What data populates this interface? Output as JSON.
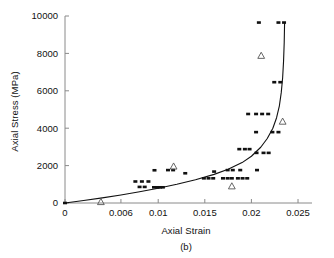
{
  "chart_data": {
    "type": "scatter",
    "title": "",
    "caption": "(b)",
    "xlabel": "Axial Strain",
    "ylabel": "Axial Stress (MPa)",
    "xlim": [
      0,
      0.0265
    ],
    "ylim": [
      0,
      10000
    ],
    "xticks": [
      0,
      0.006,
      0.01,
      0.015,
      0.02,
      0.025
    ],
    "xticklabels": [
      "0",
      "0.006",
      "0.01",
      "0.015",
      "0.02",
      "0.025"
    ],
    "yticks": [
      0,
      2000,
      4000,
      6000,
      8000,
      10000
    ],
    "yticklabels": [
      "0",
      "2000",
      "4000",
      "6000",
      "8000",
      "10000"
    ],
    "grid": false,
    "legend": null,
    "series": [
      {
        "name": "experimental-data",
        "marker": "filled-square",
        "color": "#111111",
        "points": [
          [
            0.0,
            0
          ],
          [
            0.00755,
            1150
          ],
          [
            0.00825,
            1150
          ],
          [
            0.00895,
            1150
          ],
          [
            0.008,
            860
          ],
          [
            0.00855,
            860
          ],
          [
            0.0096,
            1750
          ],
          [
            0.00955,
            840
          ],
          [
            0.0099,
            840
          ],
          [
            0.0102,
            840
          ],
          [
            0.0105,
            840
          ],
          [
            0.01105,
            1760
          ],
          [
            0.0116,
            1760
          ],
          [
            0.0129,
            1590
          ],
          [
            0.0149,
            1320
          ],
          [
            0.0154,
            1320
          ],
          [
            0.0159,
            1320
          ],
          [
            0.016,
            1680
          ],
          [
            0.01695,
            1320
          ],
          [
            0.01745,
            1320
          ],
          [
            0.0179,
            1320
          ],
          [
            0.01745,
            1760
          ],
          [
            0.018,
            1760
          ],
          [
            0.01855,
            1320
          ],
          [
            0.01905,
            1320
          ],
          [
            0.01955,
            1320
          ],
          [
            0.0187,
            2880
          ],
          [
            0.0193,
            2880
          ],
          [
            0.0198,
            2880
          ],
          [
            0.0188,
            1760
          ],
          [
            0.0206,
            1760
          ],
          [
            0.01965,
            4760
          ],
          [
            0.0205,
            4760
          ],
          [
            0.02115,
            4760
          ],
          [
            0.0218,
            4760
          ],
          [
            0.0205,
            3790
          ],
          [
            0.02055,
            2680
          ],
          [
            0.0213,
            2680
          ],
          [
            0.02185,
            2680
          ],
          [
            0.02225,
            3790
          ],
          [
            0.0229,
            3790
          ],
          [
            0.02245,
            6460
          ],
          [
            0.0231,
            6460
          ],
          [
            0.0208,
            9650
          ],
          [
            0.0229,
            9650
          ],
          [
            0.0235,
            9650
          ]
        ]
      },
      {
        "name": "model-prediction-points",
        "marker": "open-triangle",
        "color": "#555555",
        "points": [
          [
            0.00385,
            60
          ],
          [
            0.01165,
            1960
          ],
          [
            0.0179,
            900
          ],
          [
            0.02105,
            7880
          ],
          [
            0.02335,
            4360
          ]
        ]
      },
      {
        "name": "fitted-curve",
        "marker": "line",
        "color": "#111111",
        "points": [
          [
            0.0,
            0
          ],
          [
            0.002,
            130
          ],
          [
            0.004,
            275
          ],
          [
            0.006,
            430
          ],
          [
            0.008,
            600
          ],
          [
            0.01,
            790
          ],
          [
            0.012,
            1000
          ],
          [
            0.014,
            1240
          ],
          [
            0.016,
            1530
          ],
          [
            0.0175,
            1800
          ],
          [
            0.019,
            2160
          ],
          [
            0.02,
            2500
          ],
          [
            0.021,
            2980
          ],
          [
            0.0217,
            3450
          ],
          [
            0.0223,
            4000
          ],
          [
            0.0227,
            4560
          ],
          [
            0.023,
            5200
          ],
          [
            0.0232,
            5900
          ],
          [
            0.02335,
            6700
          ],
          [
            0.02345,
            7600
          ],
          [
            0.02352,
            8600
          ],
          [
            0.02356,
            9650
          ]
        ]
      }
    ]
  }
}
